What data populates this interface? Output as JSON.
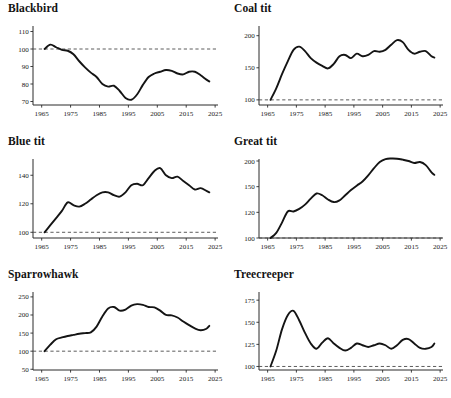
{
  "figure": {
    "type": "multi-panel-line-chart",
    "panel_count": 6,
    "columns": 2,
    "rows": 3,
    "line_color": "#141414",
    "baseline_color": "#4a4a4a",
    "background": "#ffffff",
    "baseline_value": 100,
    "baseline_style": "dashed",
    "shared_xlabel": "",
    "shared_ylabel": ""
  },
  "chart_data": [
    {
      "type": "line",
      "title": "Blackbird",
      "xlabel": "",
      "ylabel": "",
      "xlim": [
        1962,
        2026
      ],
      "ylim": [
        68,
        112
      ],
      "xticks": [
        1965,
        1975,
        1985,
        1995,
        2005,
        2015,
        2025
      ],
      "yticks": [
        70,
        80,
        90,
        100,
        110
      ],
      "grid": false,
      "legend": false,
      "baseline": 100,
      "x": [
        1966,
        1968,
        1970,
        1972,
        1974,
        1976,
        1978,
        1980,
        1982,
        1984,
        1986,
        1988,
        1990,
        1992,
        1994,
        1996,
        1998,
        2000,
        2002,
        2004,
        2006,
        2008,
        2010,
        2012,
        2014,
        2016,
        2018,
        2020,
        2022,
        2023
      ],
      "values": [
        100,
        102.5,
        101,
        99.5,
        99,
        97,
        93,
        89.5,
        86.5,
        84,
        80,
        78.5,
        79,
        76,
        72,
        71,
        74,
        79.5,
        84,
        86,
        87,
        88,
        87.5,
        86,
        85.5,
        87,
        87,
        85,
        82.5,
        81.5
      ]
    },
    {
      "type": "line",
      "title": "Coal tit",
      "xlabel": "",
      "ylabel": "",
      "xlim": [
        1962,
        2026
      ],
      "ylim": [
        92,
        212
      ],
      "xticks": [
        1965,
        1975,
        1985,
        1995,
        2005,
        2015,
        2025
      ],
      "yticks": [
        100,
        150,
        200
      ],
      "grid": false,
      "legend": false,
      "baseline": 100,
      "x": [
        1966,
        1968,
        1970,
        1972,
        1974,
        1976,
        1978,
        1980,
        1982,
        1984,
        1986,
        1988,
        1990,
        1992,
        1994,
        1996,
        1998,
        2000,
        2002,
        2004,
        2006,
        2008,
        2010,
        2012,
        2014,
        2016,
        2018,
        2020,
        2022,
        2023
      ],
      "values": [
        100,
        118,
        140,
        160,
        178,
        183,
        176,
        165,
        158,
        153,
        149,
        156,
        168,
        170,
        165,
        172,
        168,
        170,
        176,
        175,
        178,
        186,
        193,
        190,
        178,
        172,
        175,
        176,
        168,
        166
      ]
    },
    {
      "type": "line",
      "title": "Blue tit",
      "xlabel": "",
      "ylabel": "",
      "xlim": [
        1962,
        2026
      ],
      "ylim": [
        96,
        150
      ],
      "xticks": [
        1965,
        1975,
        1985,
        1995,
        2005,
        2015,
        2025
      ],
      "yticks": [
        100,
        120,
        140
      ],
      "grid": false,
      "legend": false,
      "baseline": 100,
      "x": [
        1966,
        1968,
        1970,
        1972,
        1974,
        1976,
        1978,
        1980,
        1982,
        1984,
        1986,
        1988,
        1990,
        1992,
        1994,
        1996,
        1998,
        2000,
        2002,
        2004,
        2006,
        2008,
        2010,
        2012,
        2014,
        2016,
        2018,
        2020,
        2022,
        2023
      ],
      "values": [
        100,
        105,
        110,
        115,
        121,
        119,
        118,
        120,
        123,
        126,
        128,
        128,
        126,
        125,
        128,
        133,
        134,
        133,
        138,
        143,
        145,
        140,
        138,
        139,
        136,
        133,
        130,
        131,
        129,
        128
      ]
    },
    {
      "type": "line",
      "title": "Great tit",
      "xlabel": "",
      "ylabel": "",
      "xlim": [
        1962,
        2026
      ],
      "ylim": [
        96,
        222
      ],
      "xticks": [
        1965,
        1975,
        1985,
        1995,
        2005,
        2015,
        2025
      ],
      "yticks": [
        100,
        120,
        150,
        200
      ],
      "grid": false,
      "legend": false,
      "baseline": 100,
      "x": [
        1966,
        1968,
        1970,
        1972,
        1974,
        1976,
        1978,
        1980,
        1982,
        1984,
        1986,
        1988,
        1990,
        1992,
        1994,
        1996,
        1998,
        2000,
        2002,
        2004,
        2006,
        2008,
        2010,
        2012,
        2014,
        2016,
        2018,
        2020,
        2022,
        2023
      ],
      "values": [
        100,
        104,
        112,
        121,
        121,
        124,
        129,
        136,
        142,
        140,
        135,
        132,
        134,
        140,
        146,
        152,
        160,
        172,
        186,
        198,
        212,
        215,
        214,
        208,
        200,
        196,
        198,
        192,
        178,
        173
      ]
    },
    {
      "type": "line",
      "title": "Sparrowhawk",
      "xlabel": "",
      "ylabel": "",
      "xlim": [
        1962,
        2026
      ],
      "ylim": [
        48,
        258
      ],
      "xticks": [
        1965,
        1975,
        1985,
        1995,
        2005,
        2015,
        2025
      ],
      "yticks": [
        50,
        100,
        150,
        200,
        250
      ],
      "grid": false,
      "legend": false,
      "baseline": 100,
      "x": [
        1966,
        1968,
        1970,
        1972,
        1974,
        1976,
        1978,
        1980,
        1982,
        1984,
        1986,
        1988,
        1990,
        1992,
        1994,
        1996,
        1998,
        2000,
        2002,
        2004,
        2006,
        2008,
        2010,
        2012,
        2014,
        2016,
        2018,
        2020,
        2022,
        2023
      ],
      "values": [
        100,
        118,
        133,
        138,
        142,
        145,
        148,
        150,
        152,
        168,
        196,
        218,
        222,
        212,
        215,
        226,
        230,
        228,
        222,
        221,
        212,
        200,
        199,
        193,
        182,
        172,
        163,
        158,
        162,
        170
      ]
    },
    {
      "type": "line",
      "title": "Treecreeper",
      "xlabel": "",
      "ylabel": "",
      "xlim": [
        1962,
        2026
      ],
      "ylim": [
        96,
        182
      ],
      "xticks": [
        1965,
        1975,
        1985,
        1995,
        2005,
        2015,
        2025
      ],
      "yticks": [
        100,
        125,
        150,
        175
      ],
      "grid": false,
      "legend": false,
      "baseline": 100,
      "x": [
        1966,
        1968,
        1970,
        1972,
        1974,
        1976,
        1978,
        1980,
        1982,
        1984,
        1986,
        1988,
        1990,
        1992,
        1994,
        1996,
        1998,
        2000,
        2002,
        2004,
        2006,
        2008,
        2010,
        2012,
        2014,
        2016,
        2018,
        2020,
        2022,
        2023
      ],
      "values": [
        100,
        118,
        142,
        158,
        163,
        152,
        138,
        126,
        120,
        127,
        132,
        126,
        121,
        118,
        121,
        126,
        124,
        122,
        124,
        126,
        124,
        120,
        124,
        130,
        131,
        126,
        121,
        120,
        122,
        126
      ]
    }
  ]
}
